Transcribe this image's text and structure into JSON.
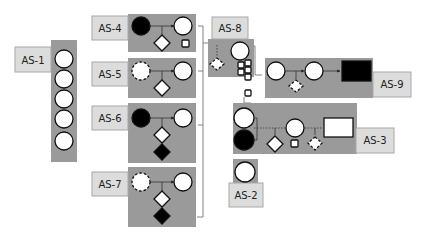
{
  "diagram": {
    "colors": {
      "panel": "#9a9a9a",
      "label_bg": "#dcdcdc",
      "node_fill_open": "#ffffff",
      "node_fill_solid": "#000000"
    },
    "groups": [
      {
        "id": "as1",
        "label": "AS-1",
        "nodes": [
          "circle",
          "circle",
          "circle",
          "circle",
          "circle"
        ]
      },
      {
        "id": "as4",
        "label": "AS-4",
        "nodes": [
          "filled-circle",
          "circle",
          "diamond",
          "small-square"
        ]
      },
      {
        "id": "as5",
        "label": "AS-5",
        "nodes": [
          "dashed-circle",
          "circle",
          "diamond"
        ]
      },
      {
        "id": "as6",
        "label": "AS-6",
        "nodes": [
          "filled-circle",
          "circle",
          "diamond",
          "filled-diamond"
        ]
      },
      {
        "id": "as7",
        "label": "AS-7",
        "nodes": [
          "dashed-circle",
          "circle",
          "diamond",
          "filled-diamond"
        ]
      },
      {
        "id": "as8",
        "label": "AS-8",
        "nodes": [
          "circle",
          "dashed-diamond",
          "small-square",
          "small-square",
          "small-square",
          "small-square",
          "small-square",
          "small-square"
        ]
      },
      {
        "id": "as9",
        "label": "AS-9",
        "nodes": [
          "circle",
          "circle",
          "dashed-diamond",
          "filled-rectangle"
        ]
      },
      {
        "id": "as3",
        "label": "AS-3",
        "nodes": [
          "circle",
          "filled-circle",
          "circle",
          "diamond",
          "small-square",
          "dashed-diamond",
          "rectangle",
          "small-square"
        ]
      },
      {
        "id": "as2",
        "label": "AS-2",
        "nodes": [
          "circle"
        ]
      }
    ]
  }
}
